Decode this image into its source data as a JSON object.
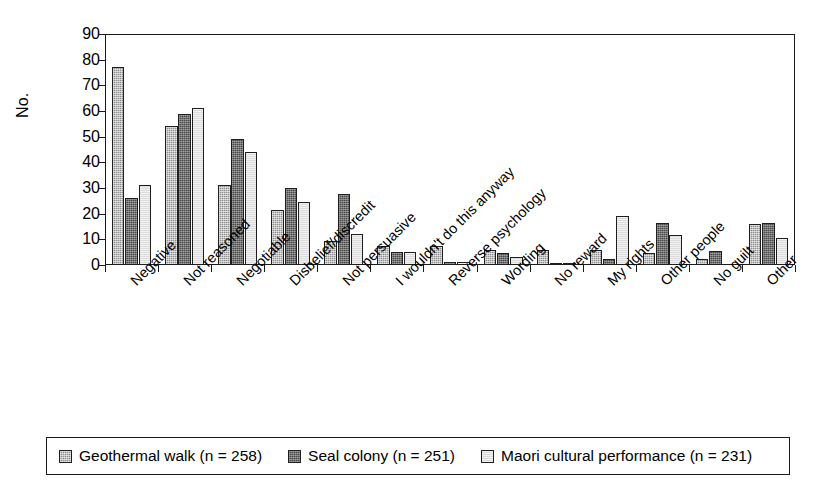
{
  "chart_data": {
    "type": "bar",
    "title": "",
    "xlabel": "",
    "ylabel": "No.",
    "ylim": [
      0,
      90
    ],
    "ytick_step": 10,
    "yticks": [
      0,
      10,
      20,
      30,
      40,
      50,
      60,
      70,
      80,
      90
    ],
    "grid": false,
    "legend_position": "bottom",
    "categories": [
      "Negative",
      "Not reasoned",
      "Negotiable",
      "Disbelief/discredit",
      "Not persuasive",
      "I wouldn't do this anyway",
      "Reverse psychology",
      "Wording",
      "No reward",
      "My rights",
      "Other people",
      "No guilt",
      "Other"
    ],
    "series": [
      {
        "name": "Geothermal walk (n = 258)",
        "color": "#8f8f8f",
        "values": [
          77,
          54,
          31,
          21.5,
          9.5,
          7.5,
          7.5,
          6,
          6,
          6,
          4.5,
          2.5,
          16
        ]
      },
      {
        "name": "Seal colony (n = 251)",
        "color": "#4a4a4a",
        "values": [
          26,
          59,
          49,
          30,
          27.5,
          5,
          1,
          4.5,
          0.5,
          2.5,
          16.5,
          5.5,
          16.5
        ]
      },
      {
        "name": "Maori cultural performance (n = 231)",
        "color": "#dcdcdc",
        "values": [
          31,
          61,
          44,
          24.5,
          12,
          5,
          1,
          3,
          0.5,
          19,
          11.5,
          0,
          10.5
        ]
      }
    ]
  },
  "legend": {
    "items": [
      {
        "label": "Geothermal walk (n = 258)",
        "swatch": "series-0-swatch"
      },
      {
        "label": "Seal colony (n = 251)",
        "swatch": "series-1-swatch"
      },
      {
        "label": "Maori cultural performance (n = 231)",
        "swatch": "series-2-swatch"
      }
    ]
  }
}
